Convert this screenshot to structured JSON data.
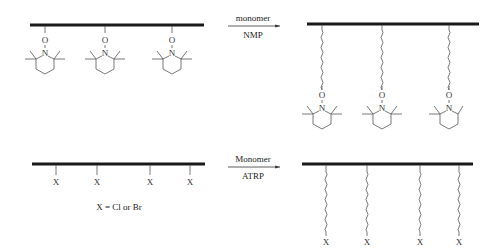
{
  "scheme_nmp": {
    "reagent_above": "monomer",
    "reagent_below": "NMP",
    "oxygen_label": "O",
    "nitrogen_label": "N",
    "reactant_pendants": 3,
    "product_pendants": 3
  },
  "scheme_atrp": {
    "reagent_above": "Monomer",
    "reagent_below": "ATRP",
    "halogen_label": "X",
    "legend": "X = Cl or Br",
    "reactant_pendants": 4,
    "product_pendants": 4
  },
  "colors": {
    "backbone": "#1a1a1a",
    "bond": "#555555",
    "text": "#222222"
  }
}
